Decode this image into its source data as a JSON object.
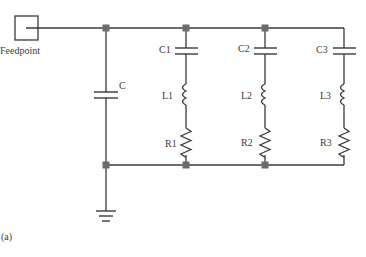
{
  "diagram": {
    "type": "circuit-schematic",
    "feedpoint_label": "Feedpoint",
    "shunt_capacitor_label": "C",
    "branches": [
      {
        "capacitor": "C1",
        "inductor": "L1",
        "resistor": "R1"
      },
      {
        "capacitor": "C2",
        "inductor": "L2",
        "resistor": "R2"
      },
      {
        "capacitor": "C3",
        "inductor": "L3",
        "resistor": "R3"
      }
    ],
    "ground": "ground-symbol",
    "panel_label": "(a)"
  },
  "colors": {
    "line": "#3a3a3a",
    "node": "#6b6b6b",
    "background": "#ffffff"
  }
}
